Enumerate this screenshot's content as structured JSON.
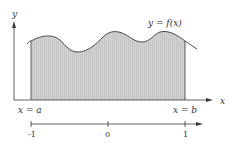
{
  "diagram": {
    "curve_label": "y = f(x)",
    "y_axis_label": "y",
    "x_axis_label": "x",
    "left_bound_label": "x = a",
    "right_bound_label": "x = b",
    "lower_axis": {
      "ticks": [
        "-1",
        "0",
        "1"
      ]
    },
    "colors": {
      "fill": "#cfcfcf",
      "stroke": "#3a3a3a",
      "text": "#333333",
      "background": "#ffffff"
    }
  }
}
